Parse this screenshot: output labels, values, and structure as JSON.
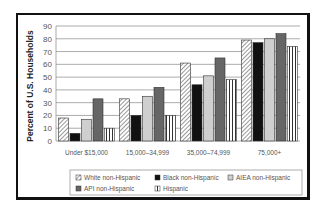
{
  "chart_data": {
    "type": "bar",
    "title": "",
    "xlabel": "",
    "ylabel": "Percent of U.S. Households",
    "ylim": [
      0,
      90
    ],
    "yticks": [
      0,
      10,
      20,
      30,
      40,
      50,
      60,
      70,
      80,
      90
    ],
    "grid": true,
    "legend_position": "bottom",
    "categories": [
      "Under $15,000",
      "15,000–34,999",
      "35,000–74,999",
      "75,000+"
    ],
    "series": [
      {
        "name": "White non-Hispanic",
        "pattern": "diagonal-hatch",
        "values": [
          18,
          33,
          61,
          79
        ]
      },
      {
        "name": "Black non-Hispanic",
        "pattern": "solid-black",
        "values": [
          6,
          20,
          44,
          77
        ]
      },
      {
        "name": "AIEA non-Hispanic",
        "pattern": "light-gray",
        "values": [
          17,
          35,
          51,
          80
        ]
      },
      {
        "name": "API non-Hispanic",
        "pattern": "dark-gray",
        "values": [
          33,
          42,
          65,
          84
        ]
      },
      {
        "name": "Hispanic",
        "pattern": "vertical-lines",
        "values": [
          10,
          20,
          48,
          74
        ]
      }
    ]
  },
  "colors": {
    "black": "#111111",
    "light_gray": "#cfcfcf",
    "dark_gray": "#666666",
    "grid": "#888888"
  }
}
